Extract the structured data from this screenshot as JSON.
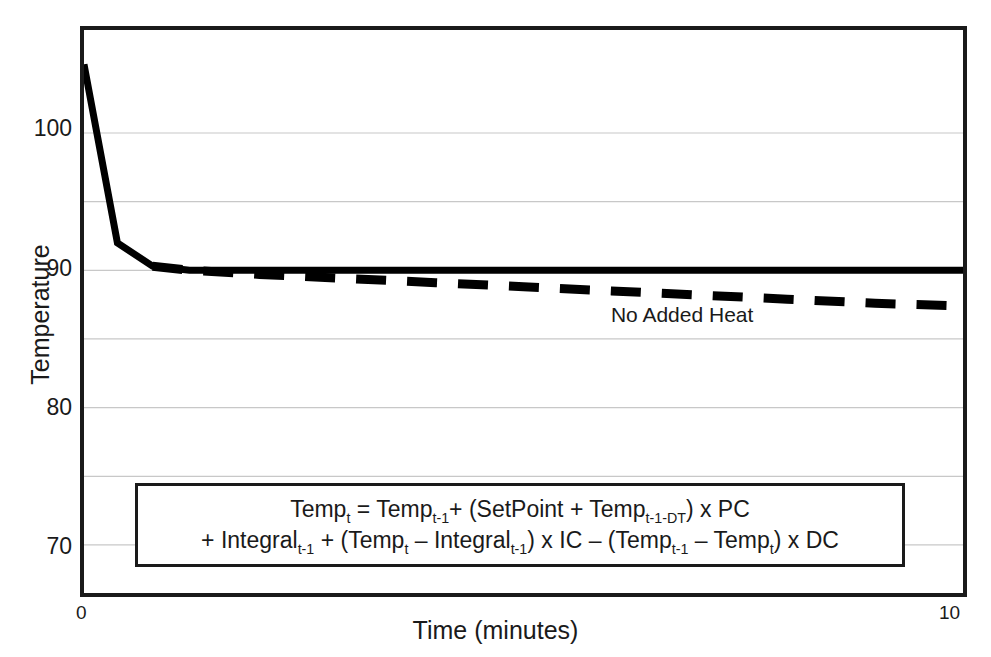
{
  "chart_data": {
    "type": "line",
    "title": "",
    "subtitle": "",
    "xlabel": "Time (minutes)",
    "ylabel": "Temperature",
    "xlim": [
      0,
      10
    ],
    "ylim": [
      66.5,
      107.5
    ],
    "xticks": [
      0,
      10
    ],
    "xticklabels": [
      "0",
      "10"
    ],
    "yticks": [
      70,
      80,
      90,
      100
    ],
    "yticklabels": [
      "70",
      "80",
      "90",
      "100"
    ],
    "gridlines_y": [
      70,
      75,
      80,
      85,
      90,
      95,
      100
    ],
    "grid": true,
    "grid_axis": "y",
    "legend": "none",
    "series": [
      {
        "name": "PID Controlled",
        "style": "solid",
        "color": "#000000",
        "x": [
          0.0,
          0.38,
          0.78,
          1.2,
          2.0,
          3.0,
          4.0,
          5.0,
          6.0,
          7.0,
          8.0,
          9.0,
          10.0
        ],
        "values": [
          105.0,
          92.0,
          90.3,
          90.0,
          90.0,
          90.0,
          90.0,
          90.0,
          90.0,
          90.0,
          90.0,
          90.0,
          90.0
        ]
      },
      {
        "name": "No Added Heat",
        "style": "dashed",
        "color": "#000000",
        "x": [
          0.78,
          1.2,
          2.0,
          3.0,
          4.0,
          5.0,
          6.0,
          7.0,
          8.0,
          9.0,
          10.0
        ],
        "values": [
          90.3,
          90.0,
          89.7,
          89.4,
          89.1,
          88.8,
          88.5,
          88.2,
          87.9,
          87.6,
          87.4
        ]
      }
    ],
    "annotations": [
      {
        "name": "no-added-heat-label",
        "text": "No Added Heat",
        "x": 7.0,
        "y": 88.2
      }
    ],
    "equation": {
      "line1": "Tempₜ = Tempₜ₋₁+ (SetPoint + Tempₜ₋₁₋₀ₜ) x PC",
      "line2": "+ Integralₜ₋₁ + (Tempₜ – Integralₜ₋₁) x IC – (Tempₜ₋₁ – Tempₜ) x DC"
    }
  },
  "axes": {
    "y_label": "Temperature",
    "x_label": "Time (minutes)",
    "y_tick_labels": [
      "100",
      "90",
      "80",
      "70"
    ],
    "x_tick_min": "0",
    "x_tick_max": "10"
  },
  "annotation": {
    "no_added_heat": "No Added Heat"
  },
  "equation": {
    "line1_parts": [
      {
        "text": "Temp",
        "sub": "t"
      },
      {
        "text": " = Temp",
        "sub": "t-1"
      },
      {
        "text": "+ (SetPoint + Temp",
        "sub": "t-1-DT"
      },
      {
        "text": ") x PC",
        "sub": ""
      }
    ],
    "line2_parts": [
      {
        "text": "+ Integral",
        "sub": "t-1"
      },
      {
        "text": " + (Temp",
        "sub": "t"
      },
      {
        "text": " – Integral",
        "sub": "t-1"
      },
      {
        "text": ") x IC – (Temp",
        "sub": "t-1"
      },
      {
        "text": " – Temp",
        "sub": "t"
      },
      {
        "text": ") x DC",
        "sub": ""
      }
    ],
    "line1_plain": "Tempt = Tempt-1+ (SetPoint + Tempt-1-DT) x PC",
    "line2_plain": "+ Integralt-1 + (Tempt – Integralt-1) x IC – (Tempt-1 – Tempt) x DC"
  },
  "colors": {
    "background": "#ffffff",
    "axis": "#1a1a1a",
    "gridline": "#c8c8c8",
    "series": "#000000"
  }
}
